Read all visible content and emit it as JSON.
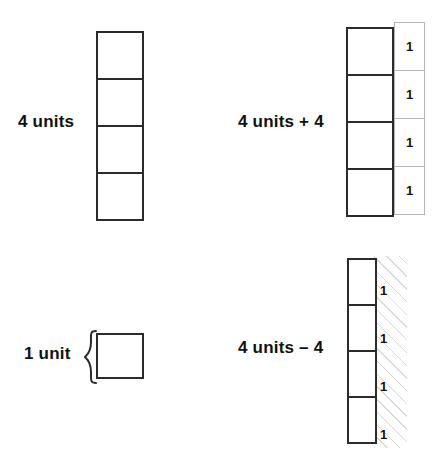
{
  "figure": {
    "title_visible": false,
    "background_color": "#ffffff",
    "square_border_color": "#2b2b2b",
    "one_box_border_color": "#b6b6b6",
    "hatch_color": "#d9d9d9",
    "text_color": "#111111"
  },
  "panels": [
    {
      "id": "four-units",
      "label": "4 units",
      "stack_count": 4,
      "one_labels": [],
      "hatched": false
    },
    {
      "id": "four-units-plus-four",
      "label": "4 units + 4",
      "stack_count": 4,
      "one_labels": [
        "1",
        "1",
        "1",
        "1"
      ],
      "hatched": false
    },
    {
      "id": "one-unit",
      "label": "1 unit",
      "stack_count": 1,
      "one_labels": [],
      "hatched": false,
      "brace": "{"
    },
    {
      "id": "four-units-minus-four",
      "label": "4 units – 4",
      "stack_count": 4,
      "one_labels": [
        "1",
        "1",
        "1",
        "1"
      ],
      "hatched": true
    }
  ],
  "labels": {
    "four_units": "4 units",
    "four_units_plus_four": "4 units + 4",
    "one_unit": "1 unit",
    "four_units_minus_four": "4 units – 4"
  },
  "one_values": {
    "plus": [
      "1",
      "1",
      "1",
      "1"
    ],
    "minus": [
      "1",
      "1",
      "1",
      "1"
    ]
  }
}
